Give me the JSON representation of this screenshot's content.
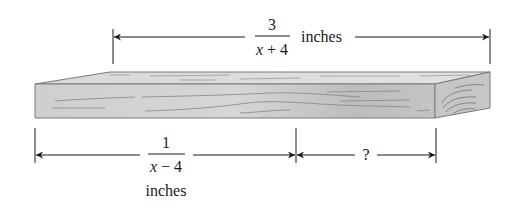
{
  "figure": {
    "top_dimension": {
      "numerator": "3",
      "denominator_var": "x",
      "denominator_rest": " + 4",
      "unit": "inches"
    },
    "bottom_left_dimension": {
      "numerator": "1",
      "denominator_var": "x",
      "denominator_rest": " − 4",
      "unit": "inches"
    },
    "bottom_right_dimension": {
      "label": "?"
    },
    "colors": {
      "line": "#1a1a1a",
      "board_front": "#c8c8c8",
      "board_top": "#dcdcdc",
      "board_end": "#bdbdbd",
      "grain": "#8a8a8a"
    }
  }
}
